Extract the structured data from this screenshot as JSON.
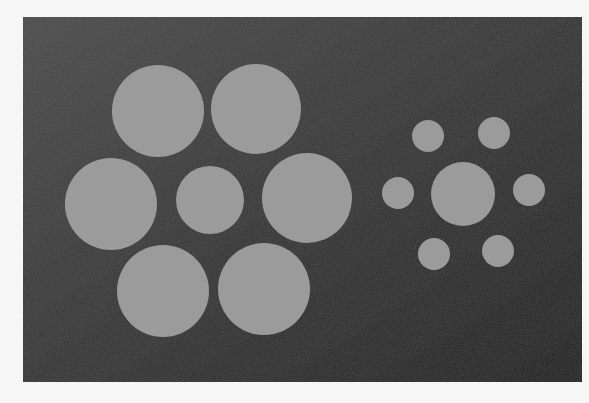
{
  "figure": {
    "name": "Ebbinghaus illusion",
    "panel": {
      "x": 23,
      "y": 17,
      "width": 559,
      "height": 365,
      "color_top_left": "#4a4a4a",
      "color_bottom_right": "#1c1c1c"
    },
    "circle_color": "#9b9b9b",
    "left_group": {
      "center": {
        "cx": 210,
        "cy": 200,
        "r": 34
      },
      "surrounding": [
        {
          "cx": 158,
          "cy": 111,
          "r": 46
        },
        {
          "cx": 256,
          "cy": 109,
          "r": 45
        },
        {
          "cx": 111,
          "cy": 204,
          "r": 46
        },
        {
          "cx": 307,
          "cy": 198,
          "r": 45
        },
        {
          "cx": 163,
          "cy": 291,
          "r": 46
        },
        {
          "cx": 264,
          "cy": 289,
          "r": 46
        }
      ]
    },
    "right_group": {
      "center": {
        "cx": 463,
        "cy": 194,
        "r": 32
      },
      "surrounding": [
        {
          "cx": 428,
          "cy": 136,
          "r": 16
        },
        {
          "cx": 494,
          "cy": 133,
          "r": 16
        },
        {
          "cx": 398,
          "cy": 193,
          "r": 16
        },
        {
          "cx": 529,
          "cy": 190,
          "r": 16
        },
        {
          "cx": 434,
          "cy": 254,
          "r": 16
        },
        {
          "cx": 498,
          "cy": 251,
          "r": 16
        }
      ]
    }
  }
}
